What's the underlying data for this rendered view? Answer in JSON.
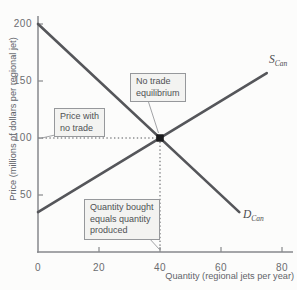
{
  "chart_data": {
    "type": "line",
    "title": "",
    "xlabel": "Quantity (regional jets per year)",
    "ylabel": "Price (millions of dollars per regional jet)",
    "xlim": [
      0,
      84
    ],
    "ylim": [
      0,
      207
    ],
    "xticks": [
      0,
      20,
      40,
      60,
      80
    ],
    "yticks": [
      50,
      100,
      150,
      200
    ],
    "grid": false,
    "legend": "none",
    "series": [
      {
        "name": "supply",
        "label_main": "S",
        "label_sub": "Can",
        "points": [
          [
            0,
            35
          ],
          [
            75,
            157
          ]
        ],
        "label_px": [
          269,
          54
        ]
      },
      {
        "name": "demand",
        "label_main": "D",
        "label_sub": "Can",
        "points": [
          [
            0,
            200
          ],
          [
            66,
            35
          ]
        ],
        "label_px": [
          243,
          209
        ]
      }
    ],
    "equilibrium": {
      "quantity": 40,
      "price": 100
    },
    "guides": [
      {
        "name": "price-guide",
        "from": [
          0,
          100
        ],
        "to": [
          40,
          100
        ]
      },
      {
        "name": "quantity-guide",
        "from": [
          40,
          100
        ],
        "to": [
          40,
          1
        ]
      }
    ],
    "colors": {
      "background": "#fcfcfb",
      "curve": "#55565a",
      "axis": "#87898c",
      "tick_label": "#6b6d70",
      "axis_label": "#62646a",
      "annotation_border": "#96989b",
      "annotation_bg": "#f3f3f1",
      "annotation_text": "#4f5154",
      "dot": "#1c1c1e",
      "guide": "#55565a",
      "pointer": "#97999c"
    },
    "px": {
      "origin": [
        38,
        252
      ],
      "per_x": 3.05,
      "per_y": 1.14,
      "x_axis_end": 293,
      "y_axis_top": 16,
      "tick_len": 5
    }
  },
  "annotations": [
    {
      "id": "price-with-no-trade",
      "text": "Price with\nno trade",
      "box_px": [
        54,
        108
      ],
      "pointer": [
        [
          55,
          135
        ],
        [
          39.5,
          138.5
        ]
      ]
    },
    {
      "id": "no-trade-equilibrium",
      "text": "No trade\nequilibrium",
      "box_px": [
        130,
        73
      ],
      "pointer": [
        [
          148.5,
          102
        ],
        [
          158.5,
          133
        ]
      ]
    },
    {
      "id": "quantity-bought-equals-quantity-produced",
      "text": "Quantity bought\nequals quantity\nproduced",
      "box_px": [
        84,
        199
      ],
      "pointer": [
        [
          148.5,
          237.5
        ],
        [
          159.5,
          249.5
        ]
      ]
    }
  ]
}
